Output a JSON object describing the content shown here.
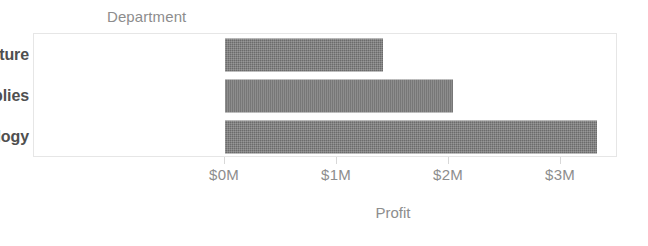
{
  "chart_data": {
    "type": "bar",
    "orientation": "horizontal",
    "title": "",
    "subtitle": "",
    "category_axis_label": "Department",
    "xlabel": "Profit",
    "ylabel": "Department",
    "categories": [
      "Furniture",
      "Office Supplies",
      "Technology"
    ],
    "values": [
      1410000,
      2040000,
      3320000
    ],
    "value_display": [
      "$1.41M",
      "$2.04M",
      "$3.32M"
    ],
    "tick_labels": [
      "$0M",
      "$1M",
      "$2M",
      "$3M"
    ],
    "tick_values": [
      0,
      1000000,
      2000000,
      3000000
    ],
    "xlim": [
      0,
      3500000
    ],
    "grid": false,
    "legend": "none",
    "series": [
      {
        "name": "Profit",
        "values": [
          1410000,
          2040000,
          3320000
        ]
      }
    ],
    "colors": {
      "bar": "#6b6b6b",
      "category_label": "#4f4f4f",
      "axis_text": "#8d8d8d",
      "plot_border": "#e6e6e6",
      "background": "#ffffff"
    }
  }
}
